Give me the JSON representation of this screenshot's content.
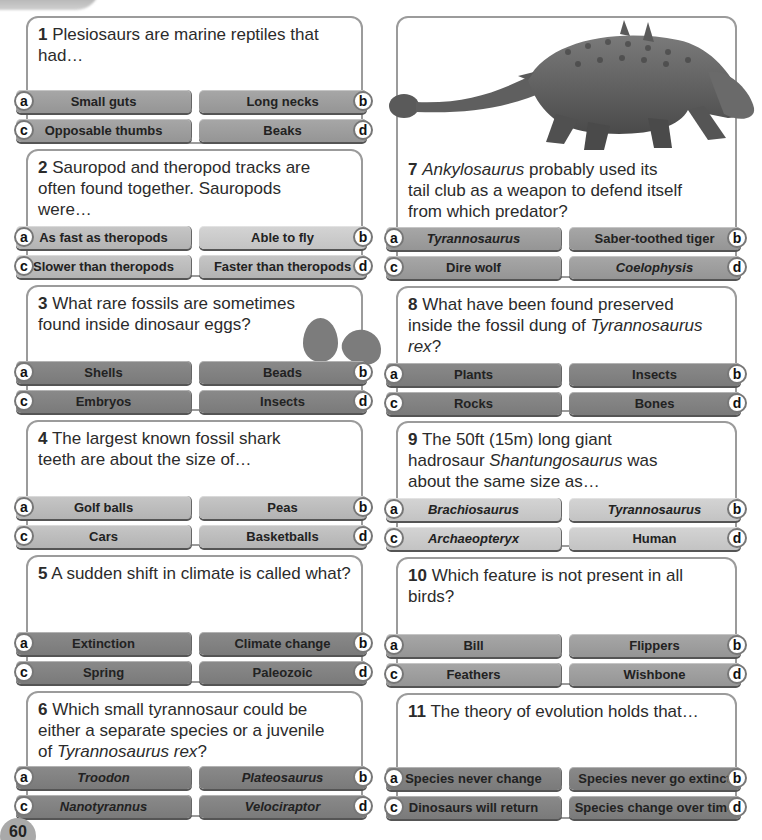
{
  "page": {
    "number": "60",
    "title_fragment": "gg"
  },
  "questions": [
    {
      "number": "1",
      "text": " Plesiosaurs are marine reptiles that had…",
      "answers": [
        {
          "letter": "a",
          "label": "Small guts"
        },
        {
          "letter": "b",
          "label": "Long necks"
        },
        {
          "letter": "c",
          "label": "Opposable thumbs"
        },
        {
          "letter": "d",
          "label": "Beaks"
        }
      ]
    },
    {
      "number": "2",
      "text": " Sauropod and theropod tracks are often found together. Sauropods were…",
      "answers": [
        {
          "letter": "a",
          "label": "As fast as theropods"
        },
        {
          "letter": "b",
          "label": "Able to fly"
        },
        {
          "letter": "c",
          "label": "Slower than theropods"
        },
        {
          "letter": "d",
          "label": "Faster than theropods"
        }
      ]
    },
    {
      "number": "3",
      "text": " What rare fossils are sometimes found inside dinosaur eggs?",
      "answers": [
        {
          "letter": "a",
          "label": "Shells"
        },
        {
          "letter": "b",
          "label": "Beads"
        },
        {
          "letter": "c",
          "label": "Embryos"
        },
        {
          "letter": "d",
          "label": "Insects"
        }
      ]
    },
    {
      "number": "4",
      "text": " The largest known fossil shark teeth are about the size of…",
      "answers": [
        {
          "letter": "a",
          "label": "Golf balls"
        },
        {
          "letter": "b",
          "label": "Peas"
        },
        {
          "letter": "c",
          "label": "Cars"
        },
        {
          "letter": "d",
          "label": "Basketballs"
        }
      ]
    },
    {
      "number": "5",
      "text": " A sudden shift in climate is called what?",
      "answers": [
        {
          "letter": "a",
          "label": "Extinction"
        },
        {
          "letter": "b",
          "label": "Climate change"
        },
        {
          "letter": "c",
          "label": "Spring"
        },
        {
          "letter": "d",
          "label": "Paleozoic"
        }
      ]
    },
    {
      "number": "6",
      "text_parts": [
        " Which small tyrannosaur could be either a separate species or a juvenile of ",
        "Tyrannosaurus rex",
        "?"
      ],
      "answers": [
        {
          "letter": "a",
          "label": "Troodon"
        },
        {
          "letter": "b",
          "label": "Plateosaurus"
        },
        {
          "letter": "c",
          "label": "Nanotyrannus"
        },
        {
          "letter": "d",
          "label": "Velociraptor"
        }
      ]
    },
    {
      "number": "7",
      "text_parts": [
        " ",
        "Ankylosaurus",
        " probably used its tail club as a weapon to defend itself from which predator?"
      ],
      "answers": [
        {
          "letter": "a",
          "label": "Tyrannosaurus"
        },
        {
          "letter": "b",
          "label": "Saber-toothed tiger"
        },
        {
          "letter": "c",
          "label": "Dire wolf"
        },
        {
          "letter": "d",
          "label": "Coelophysis"
        }
      ]
    },
    {
      "number": "8",
      "text_parts": [
        " What have been found preserved inside the fossil dung of ",
        "Tyrannosaurus rex",
        "?"
      ],
      "answers": [
        {
          "letter": "a",
          "label": "Plants"
        },
        {
          "letter": "b",
          "label": "Insects"
        },
        {
          "letter": "c",
          "label": "Rocks"
        },
        {
          "letter": "d",
          "label": "Bones"
        }
      ]
    },
    {
      "number": "9",
      "text_parts": [
        " The 50ft (15m) long giant hadrosaur ",
        "Shantungosaurus",
        " was about the same size as…"
      ],
      "answers": [
        {
          "letter": "a",
          "label": "Brachiosaurus"
        },
        {
          "letter": "b",
          "label": "Tyrannosaurus"
        },
        {
          "letter": "c",
          "label": "Archaeopteryx"
        },
        {
          "letter": "d",
          "label": "Human"
        }
      ]
    },
    {
      "number": "10",
      "text": " Which feature is not present in all birds?",
      "answers": [
        {
          "letter": "a",
          "label": "Bill"
        },
        {
          "letter": "b",
          "label": "Flippers"
        },
        {
          "letter": "c",
          "label": "Feathers"
        },
        {
          "letter": "d",
          "label": "Wishbone"
        }
      ]
    },
    {
      "number": "11",
      "text": " The theory of evolution holds that…",
      "answers": [
        {
          "letter": "a",
          "label": "Species never change"
        },
        {
          "letter": "b",
          "label": "Species never go extinct"
        },
        {
          "letter": "c",
          "label": "Dinosaurs will return"
        },
        {
          "letter": "d",
          "label": "Species change over time"
        }
      ]
    }
  ],
  "images": {
    "dinosaur": "ankylosaurus-illustration",
    "eggs": "dinosaur-eggs-illustration"
  },
  "colors": {
    "card_border": "#9b9b9b",
    "answer_light": "#c6c6c6",
    "answer_mid": "#a7a7a7",
    "answer_dark": "#8a8a8a",
    "page_badge": "#a9a9a9"
  }
}
